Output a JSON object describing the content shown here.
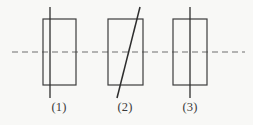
{
  "figure": {
    "title": "",
    "background_color": "#f8f8f6",
    "stroke_color": "#3d3d3d",
    "dashed_axis_color": "#6f6f6f",
    "labels": [
      {
        "id": "label-1",
        "text": "(1)"
      },
      {
        "id": "label-2",
        "text": "(2)"
      },
      {
        "id": "label-3",
        "text": "(3)"
      }
    ],
    "horizontal_dashed_axis": {
      "name": "horizontal-axis-of-symmetry",
      "x1": 12,
      "y1": 52,
      "x2": 245,
      "y2": 52,
      "dash_pattern": "6 4"
    },
    "panels": [
      {
        "name": "panel-1",
        "label": "(1)",
        "rectangle": {
          "x": 43,
          "y": 19,
          "width": 33,
          "height": 66
        },
        "axis_line": {
          "name": "vertical-axis-off-center",
          "x1": 50,
          "y1": 7,
          "x2": 50,
          "y2": 98,
          "orientation": "vertical",
          "position": "left-of-center"
        }
      },
      {
        "name": "panel-2",
        "label": "(2)",
        "rectangle": {
          "x": 108,
          "y": 19,
          "width": 35,
          "height": 66
        },
        "axis_line": {
          "name": "diagonal-axis",
          "x1": 117,
          "y1": 98,
          "x2": 140,
          "y2": 7,
          "orientation": "diagonal",
          "position": "slanted-through-center"
        }
      },
      {
        "name": "panel-3",
        "label": "(3)",
        "rectangle": {
          "x": 173,
          "y": 19,
          "width": 34,
          "height": 66
        },
        "axis_line": {
          "name": "vertical-axis-centered",
          "x1": 190,
          "y1": 7,
          "x2": 190,
          "y2": 98,
          "orientation": "vertical",
          "position": "center"
        }
      }
    ]
  }
}
